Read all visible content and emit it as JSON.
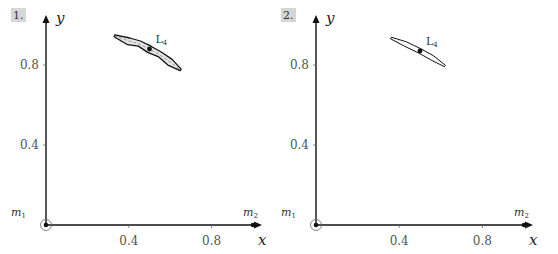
{
  "chart_data": [
    {
      "type": "scatter",
      "panel_label": "1.",
      "xlabel": "x",
      "ylabel": "y",
      "xlim": [
        0,
        1.05
      ],
      "ylim": [
        0,
        1.05
      ],
      "xticks": [
        0.4,
        0.8
      ],
      "xtick_labels": [
        "0.4",
        "0.8"
      ],
      "yticks": [
        0.4,
        0.8
      ],
      "ytick_labels": [
        "0.4",
        "0.8"
      ],
      "grid": false,
      "masses": [
        {
          "label": "m1",
          "label_base": "m",
          "label_sub": "1",
          "x": 0.0,
          "y": 0.0,
          "circled": true
        },
        {
          "label": "m2",
          "label_base": "m",
          "label_sub": "2",
          "x": 1.0,
          "y": 0.0,
          "circled": false
        }
      ],
      "lagrange_point": {
        "label": "L4",
        "label_base": "L",
        "label_sub": "4",
        "x": 0.5,
        "y": 0.88
      },
      "orbit_band": {
        "style": "rough",
        "start": [
          0.33,
          0.945
        ],
        "end": [
          0.65,
          0.775
        ],
        "points": [
          [
            0.33,
            0.945
          ],
          [
            0.4,
            0.92
          ],
          [
            0.45,
            0.905
          ],
          [
            0.5,
            0.88
          ],
          [
            0.55,
            0.85
          ],
          [
            0.6,
            0.815
          ],
          [
            0.65,
            0.775
          ]
        ]
      }
    },
    {
      "type": "scatter",
      "panel_label": "2.",
      "xlabel": "x",
      "ylabel": "y",
      "xlim": [
        0,
        1.05
      ],
      "ylim": [
        0,
        1.05
      ],
      "xticks": [
        0.4,
        0.8
      ],
      "xtick_labels": [
        "0.4",
        "0.8"
      ],
      "yticks": [
        0.4,
        0.8
      ],
      "ytick_labels": [
        "0.4",
        "0.8"
      ],
      "grid": false,
      "masses": [
        {
          "label": "m1",
          "label_base": "m",
          "label_sub": "1",
          "x": 0.0,
          "y": 0.0,
          "circled": true
        },
        {
          "label": "m2",
          "label_base": "m",
          "label_sub": "2",
          "x": 1.0,
          "y": 0.0,
          "circled": false
        }
      ],
      "lagrange_point": {
        "label": "L4",
        "label_base": "L",
        "label_sub": "4",
        "x": 0.5,
        "y": 0.87
      },
      "orbit_band": {
        "style": "smooth",
        "start": [
          0.36,
          0.935
        ],
        "end": [
          0.62,
          0.795
        ],
        "points": [
          [
            0.36,
            0.935
          ],
          [
            0.43,
            0.905
          ],
          [
            0.5,
            0.87
          ],
          [
            0.56,
            0.835
          ],
          [
            0.62,
            0.795
          ]
        ]
      }
    }
  ]
}
